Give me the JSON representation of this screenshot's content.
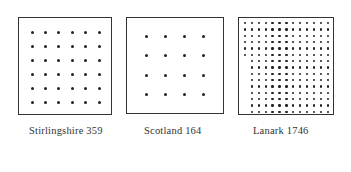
{
  "panels": [
    {
      "name": "Stirlingshire",
      "value": "359",
      "label": "Stirlingshire 359",
      "rows": 6,
      "cols": 6,
      "box": [
        18,
        17,
        94,
        98
      ]
    },
    {
      "name": "Scotland",
      "value": "164",
      "label": "Scotland 164",
      "rows": 4,
      "cols": 4,
      "box": [
        126,
        17,
        98,
        97
      ]
    },
    {
      "name": "Lanark",
      "value": "1746",
      "label": "Lanark 1746",
      "rows": 15,
      "cols": 13,
      "upper_full_rows": 6,
      "box": [
        238,
        17,
        96,
        98
      ]
    }
  ],
  "colors": {
    "dot": "#222222",
    "border": "#333333",
    "text": "#333333"
  }
}
